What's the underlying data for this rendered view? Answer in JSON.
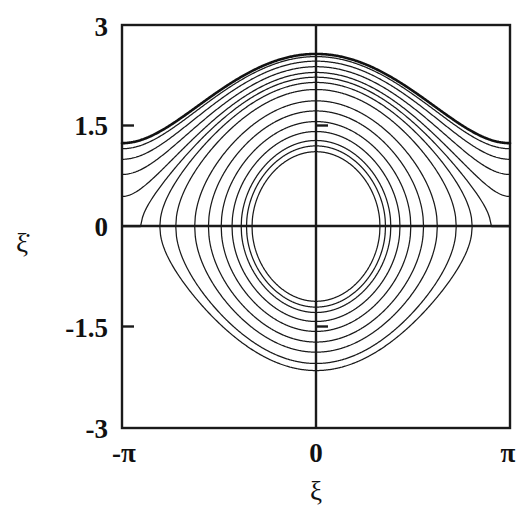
{
  "chart_data": {
    "type": "line",
    "title": "",
    "subtitle": "",
    "xlabel": "ξ",
    "ylabel": "ξ̇",
    "xlim": [
      -3.141592653589793,
      3.141592653589793
    ],
    "ylim": [
      -3,
      3
    ],
    "xticks": [
      -3.141592653589793,
      0,
      3.141592653589793
    ],
    "xticklabels": [
      "-π",
      "0",
      "π"
    ],
    "yticks": [
      -3,
      -1.5,
      0,
      1.5,
      3
    ],
    "yticklabels": [
      "-3",
      "-1.5",
      "0",
      "1.5",
      "3"
    ],
    "grid": false,
    "legend": false,
    "legend_position": "none",
    "axis_cross_at": [
      0,
      0
    ],
    "hamiltonian": "H = 0.5*xidot^2 + k*(1 - cos(xi))",
    "k": 1.265,
    "separatrix_peak": 2.25,
    "series": [
      {
        "name": "rotating-1",
        "kind": "rotating",
        "H": 3.3,
        "xidot_at_0": 2.25,
        "xidot_at_pi": 1.02
      },
      {
        "name": "rotating-2",
        "kind": "rotating",
        "H": 3.2,
        "xidot_at_0": 2.21,
        "xidot_at_pi": 0.97
      },
      {
        "name": "rotating-3",
        "kind": "rotating",
        "H": 3.03,
        "xidot_at_0": 2.16,
        "xidot_at_pi": 0.88
      },
      {
        "name": "rotating-4",
        "kind": "rotating",
        "H": 2.83,
        "xidot_at_0": 2.09,
        "xidot_at_pi": 0.76
      },
      {
        "name": "rotating-5",
        "kind": "rotating",
        "H": 2.63,
        "xidot_at_0": 2.02,
        "xidot_at_pi": 0.61
      },
      {
        "name": "rotating-6",
        "kind": "rotating",
        "H": 2.47,
        "xidot_at_0": 1.96,
        "xidot_at_pi": 0.44
      },
      {
        "name": "librating-1",
        "kind": "librating",
        "H": 2.3,
        "xidot_at_0": 1.9,
        "xi_turning": 2.81
      },
      {
        "name": "librating-2",
        "kind": "librating",
        "H": 2.08,
        "xidot_at_0": 1.8,
        "xi_turning": 2.6
      },
      {
        "name": "librating-3",
        "kind": "librating",
        "H": 1.75,
        "xidot_at_0": 1.65,
        "xi_turning": 2.33
      },
      {
        "name": "librating-4",
        "kind": "librating",
        "H": 1.48,
        "xidot_at_0": 1.52,
        "xi_turning": 2.11
      },
      {
        "name": "librating-5",
        "kind": "librating",
        "H": 1.22,
        "xidot_at_0": 1.38,
        "xi_turning": 1.88
      },
      {
        "name": "librating-6",
        "kind": "librating",
        "H": 1.0,
        "xidot_at_0": 1.25,
        "xi_turning": 1.68
      },
      {
        "name": "librating-7",
        "kind": "librating",
        "H": 0.82,
        "xidot_at_0": 1.13,
        "xi_turning": 1.5
      },
      {
        "name": "librating-8",
        "kind": "librating",
        "H": 0.72,
        "xidot_at_0": 1.06,
        "xi_turning": 1.4
      },
      {
        "name": "librating-9",
        "kind": "librating",
        "H": 0.62,
        "xidot_at_0": 0.99,
        "xi_turning": 1.29
      }
    ]
  },
  "axes": {
    "y_top_label": "3",
    "y_mid_upper_label": "1.5",
    "y_zero_label": "0",
    "y_mid_lower_label": "-1.5",
    "y_bottom_label": "-3",
    "x_left_label": "-π",
    "x_center_label": "0",
    "x_right_label": "π",
    "x_axis_title": "ξ",
    "y_axis_title": "ξ̇"
  },
  "colors": {
    "line": "#1a1a1a",
    "background": "#ffffff",
    "text": "#111111"
  }
}
